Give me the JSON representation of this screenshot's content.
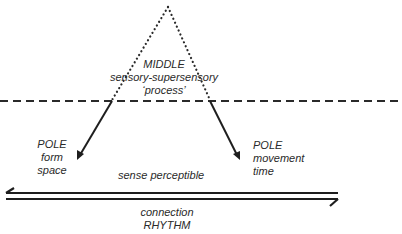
{
  "diagram": {
    "middle": {
      "title": "MIDDLE",
      "line1": "sensory-supersensory",
      "line2": "‘process’"
    },
    "left_pole": {
      "title": "POLE",
      "line1": "form",
      "line2": "space"
    },
    "right_pole": {
      "title": "POLE",
      "line1": "movement",
      "line2": "time"
    },
    "center_label": "sense perceptible",
    "bottom": {
      "line1": "connection",
      "line2": "RHYTHM"
    },
    "colors": {
      "ink": "#2a2a2a",
      "background": "#ffffff"
    }
  }
}
